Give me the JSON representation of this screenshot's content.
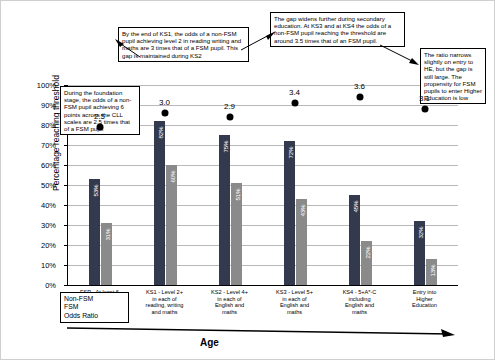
{
  "chart_data": {
    "type": "bar",
    "title": "",
    "xlabel": "Age",
    "ylabel": "Percentage reaching threshold",
    "ylim": [
      0,
      100
    ],
    "ytick_labels": [
      "0%",
      "10%",
      "20%",
      "30%",
      "40%",
      "50%",
      "60%",
      "70%",
      "80%",
      "90%",
      "100%"
    ],
    "ytick_values": [
      0,
      10,
      20,
      30,
      40,
      50,
      60,
      70,
      80,
      90,
      100
    ],
    "grid": true,
    "legend_position": "bottom-left",
    "categories": [
      "FSP - At least 6 in all 4 communication, language and literacy scales",
      "KS1 - Level 2+ in each of reading, writing and maths",
      "KS2 - Level 4+ in each of English and maths",
      "KS3 - Level 5+ in each of English and maths",
      "KS4 - 5+A*-C including English and maths",
      "Entry into Higher Education"
    ],
    "category_lines": [
      [
        "FSP - At least 6",
        "in all 4",
        "communication,",
        "language and",
        "literacy scales"
      ],
      [
        "KS1 - Level 2+",
        "in each of",
        "reading, writing",
        "and maths"
      ],
      [
        "KS2 - Level 4+",
        "in each of",
        "English and",
        "maths"
      ],
      [
        "KS3 - Level 5+",
        "in each of",
        "English and",
        "maths"
      ],
      [
        "KS4 - 5+A*-C",
        "including",
        "English and",
        "maths"
      ],
      [
        "Entry into",
        "Higher",
        "Education"
      ]
    ],
    "series": [
      {
        "name": "Non-FSM",
        "color": "#333a4d",
        "values": [
          53,
          82,
          75,
          72,
          45,
          32
        ],
        "labels": [
          "53%",
          "82%",
          "75%",
          "72%",
          "45%",
          "32%"
        ]
      },
      {
        "name": "FSM",
        "color": "#8a8a8a",
        "values": [
          31,
          60,
          51,
          43,
          22,
          13
        ],
        "labels": [
          "31%",
          "60%",
          "51%",
          "43%",
          "22%",
          "13%"
        ]
      }
    ],
    "odds_ratio": {
      "name": "Odds Ratio",
      "color": "#000000",
      "values": [
        2.5,
        3.0,
        2.9,
        3.4,
        3.6,
        3.1
      ],
      "labels": [
        "2.5",
        "3.0",
        "2.9",
        "3.4",
        "3.6",
        "3.1"
      ],
      "plot_y_percent": [
        79,
        86,
        84,
        91,
        94,
        88
      ]
    }
  },
  "legend": {
    "items": [
      "Non-FSM",
      "FSM",
      "Odds Ratio"
    ]
  },
  "annotations": [
    {
      "id": "foundation-stage-note",
      "text": "During the foundation stage, the odds of a non-FSM pupil achieving 6 points across the CLL scales are 2.5 times that of a FSM pupil"
    },
    {
      "id": "ks1-ks2-note",
      "text": "By the end of KS1, the odds of a non-FSM pupil achieving level 2 in reading writing and maths are 3 times that of a FSM pupil. This gap is maintained during KS2"
    },
    {
      "id": "secondary-note",
      "text": "The gap widens further during secondary education. At KS3 and at KS4 the odds of a non-FSM pupil reaching the threshold are around 3.5 times that of an FSM pupil."
    },
    {
      "id": "he-note",
      "text": "The ratio narrows slightly on entry to HE, but the gap is still large. The propensity for FSM pupils to enter Higher Education is low"
    }
  ]
}
